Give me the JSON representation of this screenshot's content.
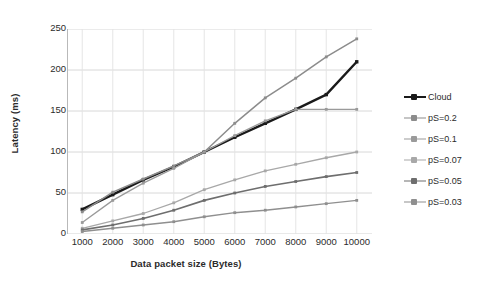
{
  "chart_data": {
    "type": "line",
    "title": "",
    "xlabel": "Data packet size (Bytes)",
    "ylabel": "Latency (ms)",
    "categories": [
      1000,
      2000,
      3000,
      4000,
      5000,
      6000,
      7000,
      8000,
      9000,
      10000
    ],
    "xtick_labels": [
      "1000",
      "2000",
      "3000",
      "4000",
      "5000",
      "6000",
      "7000",
      "8000",
      "9000",
      "10000"
    ],
    "ytick_labels": [
      "0",
      "50",
      "100",
      "150",
      "200",
      "250"
    ],
    "yticks": [
      0,
      50,
      100,
      150,
      200,
      250
    ],
    "ylim": [
      0,
      250
    ],
    "grid": "horizontal-and-vertical",
    "legend_position": "right",
    "series": [
      {
        "name": "Cloud",
        "color": "#1a1a1a",
        "width": 2.4,
        "marker": "square",
        "values": [
          30,
          48,
          66,
          82,
          100,
          118,
          135,
          152,
          170,
          210
        ]
      },
      {
        "name": "pS=0.2",
        "color": "#8c8c8c",
        "width": 1.5,
        "marker": "square",
        "values": [
          27,
          51,
          67,
          83,
          100,
          135,
          166,
          190,
          216,
          238
        ]
      },
      {
        "name": "pS=0.1",
        "color": "#9a9a9a",
        "width": 1.3,
        "marker": "square",
        "values": [
          14,
          41,
          62,
          80,
          100,
          120,
          138,
          152,
          152,
          152
        ]
      },
      {
        "name": "pS=0.07",
        "color": "#a8a8a8",
        "width": 1.3,
        "marker": "square",
        "values": [
          7,
          16,
          25,
          38,
          54,
          66,
          77,
          85,
          93,
          100
        ]
      },
      {
        "name": "pS=0.05",
        "color": "#6e6e6e",
        "width": 1.6,
        "marker": "square",
        "values": [
          5,
          11,
          19,
          29,
          41,
          50,
          58,
          64,
          70,
          75
        ]
      },
      {
        "name": "pS=0.03",
        "color": "#8f8f8f",
        "width": 1.4,
        "marker": "square",
        "values": [
          3,
          7,
          11,
          15,
          21,
          26,
          29,
          33,
          37,
          41
        ]
      }
    ]
  }
}
